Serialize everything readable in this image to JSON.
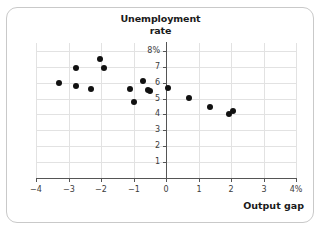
{
  "chart_data": {
    "type": "scatter",
    "title": "Unemployment rate",
    "title_lines": [
      "Unemployment",
      "rate"
    ],
    "xlabel": "Output gap",
    "ylabel": "Unemployment rate",
    "xlim": [
      -4,
      4
    ],
    "ylim": [
      0,
      8.5
    ],
    "grid": true,
    "legend": null,
    "x_ticks": [
      -4,
      -3,
      -2,
      -1,
      0,
      1,
      2,
      3,
      4
    ],
    "x_tick_labels": [
      "−4",
      "−3",
      "−2",
      "−1",
      "0",
      "1",
      "2",
      "3",
      "4%"
    ],
    "y_ticks": [
      1,
      2,
      3,
      4,
      5,
      6,
      7,
      8
    ],
    "y_tick_labels": [
      "1",
      "2",
      "3",
      "4",
      "5",
      "6",
      "7",
      "8%"
    ],
    "point_color": "#111111",
    "grid_color": "#e2e2e2",
    "axis_color": "#555555",
    "points": [
      {
        "x": -3.3,
        "y": 6.0
      },
      {
        "x": -2.78,
        "y": 6.95
      },
      {
        "x": -2.78,
        "y": 5.8
      },
      {
        "x": -2.32,
        "y": 5.62
      },
      {
        "x": -2.02,
        "y": 7.48
      },
      {
        "x": -1.92,
        "y": 6.95
      },
      {
        "x": -1.1,
        "y": 5.62
      },
      {
        "x": -1.0,
        "y": 4.78
      },
      {
        "x": -0.72,
        "y": 6.08
      },
      {
        "x": -0.55,
        "y": 5.55
      },
      {
        "x": -0.5,
        "y": 5.45
      },
      {
        "x": 0.06,
        "y": 5.65
      },
      {
        "x": 0.7,
        "y": 5.02
      },
      {
        "x": 1.35,
        "y": 4.5
      },
      {
        "x": 1.95,
        "y": 4.02
      },
      {
        "x": 2.05,
        "y": 4.22
      }
    ]
  }
}
